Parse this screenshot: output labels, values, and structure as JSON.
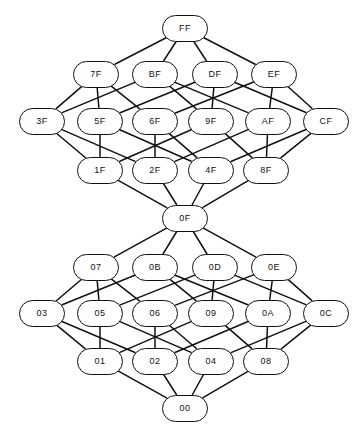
{
  "diagram": {
    "type": "hasse-lattice",
    "node_shape": "stadium",
    "stroke_color": "#111111",
    "fill_color": "#ffffff",
    "edge_color": "#111111",
    "node_width": 46,
    "node_height": 27,
    "nodes": [
      {
        "id": "FF",
        "label": "FF",
        "x": 185,
        "y": 28,
        "rank": 0
      },
      {
        "id": "7F",
        "label": "7F",
        "x": 96,
        "y": 74,
        "rank": 1
      },
      {
        "id": "BF",
        "label": "BF",
        "x": 155,
        "y": 74,
        "rank": 1
      },
      {
        "id": "DF",
        "label": "DF",
        "x": 215,
        "y": 74,
        "rank": 1
      },
      {
        "id": "EF",
        "label": "EF",
        "x": 274,
        "y": 74,
        "rank": 1
      },
      {
        "id": "3F",
        "label": "3F",
        "x": 42,
        "y": 121,
        "rank": 2
      },
      {
        "id": "5F",
        "label": "5F",
        "x": 100,
        "y": 121,
        "rank": 2
      },
      {
        "id": "6F",
        "label": "6F",
        "x": 155,
        "y": 121,
        "rank": 2
      },
      {
        "id": "9F",
        "label": "9F",
        "x": 211,
        "y": 121,
        "rank": 2
      },
      {
        "id": "AF",
        "label": "AF",
        "x": 268,
        "y": 121,
        "rank": 2
      },
      {
        "id": "CF",
        "label": "CF",
        "x": 326,
        "y": 121,
        "rank": 2
      },
      {
        "id": "1F",
        "label": "1F",
        "x": 100,
        "y": 170,
        "rank": 3
      },
      {
        "id": "2F",
        "label": "2F",
        "x": 155,
        "y": 170,
        "rank": 3
      },
      {
        "id": "4F",
        "label": "4F",
        "x": 211,
        "y": 170,
        "rank": 3
      },
      {
        "id": "8F",
        "label": "8F",
        "x": 266,
        "y": 170,
        "rank": 3
      },
      {
        "id": "0F",
        "label": "0F",
        "x": 185,
        "y": 218,
        "rank": 4
      },
      {
        "id": "07",
        "label": "07",
        "x": 96,
        "y": 267,
        "rank": 5
      },
      {
        "id": "0B",
        "label": "0B",
        "x": 155,
        "y": 267,
        "rank": 5
      },
      {
        "id": "0D",
        "label": "0D",
        "x": 215,
        "y": 267,
        "rank": 5
      },
      {
        "id": "0E",
        "label": "0E",
        "x": 274,
        "y": 267,
        "rank": 5
      },
      {
        "id": "03",
        "label": "03",
        "x": 42,
        "y": 313,
        "rank": 6
      },
      {
        "id": "05",
        "label": "05",
        "x": 100,
        "y": 313,
        "rank": 6
      },
      {
        "id": "06",
        "label": "06",
        "x": 155,
        "y": 313,
        "rank": 6
      },
      {
        "id": "09",
        "label": "09",
        "x": 211,
        "y": 313,
        "rank": 6
      },
      {
        "id": "0A",
        "label": "0A",
        "x": 268,
        "y": 313,
        "rank": 6
      },
      {
        "id": "0C",
        "label": "0C",
        "x": 326,
        "y": 313,
        "rank": 6
      },
      {
        "id": "01",
        "label": "01",
        "x": 100,
        "y": 361,
        "rank": 7
      },
      {
        "id": "02",
        "label": "02",
        "x": 155,
        "y": 361,
        "rank": 7
      },
      {
        "id": "04",
        "label": "04",
        "x": 211,
        "y": 361,
        "rank": 7
      },
      {
        "id": "08",
        "label": "08",
        "x": 266,
        "y": 361,
        "rank": 7
      },
      {
        "id": "00",
        "label": "00",
        "x": 185,
        "y": 408,
        "rank": 8
      }
    ],
    "edges": [
      [
        "FF",
        "7F"
      ],
      [
        "FF",
        "BF"
      ],
      [
        "FF",
        "DF"
      ],
      [
        "FF",
        "EF"
      ],
      [
        "7F",
        "3F"
      ],
      [
        "7F",
        "5F"
      ],
      [
        "7F",
        "6F"
      ],
      [
        "BF",
        "3F"
      ],
      [
        "BF",
        "9F"
      ],
      [
        "BF",
        "AF"
      ],
      [
        "DF",
        "5F"
      ],
      [
        "DF",
        "9F"
      ],
      [
        "DF",
        "CF"
      ],
      [
        "EF",
        "6F"
      ],
      [
        "EF",
        "AF"
      ],
      [
        "EF",
        "CF"
      ],
      [
        "3F",
        "1F"
      ],
      [
        "3F",
        "2F"
      ],
      [
        "5F",
        "1F"
      ],
      [
        "5F",
        "4F"
      ],
      [
        "6F",
        "2F"
      ],
      [
        "6F",
        "4F"
      ],
      [
        "9F",
        "1F"
      ],
      [
        "9F",
        "8F"
      ],
      [
        "AF",
        "2F"
      ],
      [
        "AF",
        "8F"
      ],
      [
        "CF",
        "4F"
      ],
      [
        "CF",
        "8F"
      ],
      [
        "1F",
        "0F"
      ],
      [
        "2F",
        "0F"
      ],
      [
        "4F",
        "0F"
      ],
      [
        "8F",
        "0F"
      ],
      [
        "0F",
        "07"
      ],
      [
        "0F",
        "0B"
      ],
      [
        "0F",
        "0D"
      ],
      [
        "0F",
        "0E"
      ],
      [
        "07",
        "03"
      ],
      [
        "07",
        "05"
      ],
      [
        "07",
        "06"
      ],
      [
        "0B",
        "03"
      ],
      [
        "0B",
        "09"
      ],
      [
        "0B",
        "0A"
      ],
      [
        "0D",
        "05"
      ],
      [
        "0D",
        "09"
      ],
      [
        "0D",
        "0C"
      ],
      [
        "0E",
        "06"
      ],
      [
        "0E",
        "0A"
      ],
      [
        "0E",
        "0C"
      ],
      [
        "03",
        "01"
      ],
      [
        "03",
        "02"
      ],
      [
        "05",
        "01"
      ],
      [
        "05",
        "04"
      ],
      [
        "06",
        "02"
      ],
      [
        "06",
        "04"
      ],
      [
        "09",
        "01"
      ],
      [
        "09",
        "08"
      ],
      [
        "0A",
        "02"
      ],
      [
        "0A",
        "08"
      ],
      [
        "0C",
        "04"
      ],
      [
        "0C",
        "08"
      ],
      [
        "01",
        "00"
      ],
      [
        "02",
        "00"
      ],
      [
        "04",
        "00"
      ],
      [
        "08",
        "00"
      ]
    ]
  }
}
